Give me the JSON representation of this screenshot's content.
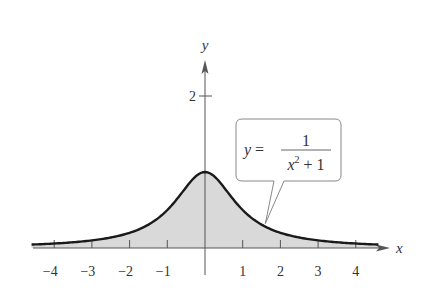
{
  "chart_data": {
    "type": "area",
    "title": "",
    "function": "y = 1/(x^2 + 1)",
    "xlabel": "x",
    "ylabel": "y",
    "xlim": [
      -4.7,
      4.7
    ],
    "ylim": [
      0,
      2.4
    ],
    "x_ticks": [
      -4,
      -3,
      -2,
      -1,
      1,
      2,
      3,
      4
    ],
    "x_tick_labels": [
      "−4",
      "−3",
      "−2",
      "−1",
      "1",
      "2",
      "3",
      "4"
    ],
    "y_ticks": [
      2
    ],
    "y_tick_labels": [
      "2"
    ],
    "grid": false,
    "shaded_region": "between curve and x-axis",
    "series": [
      {
        "name": "y = 1/(x^2+1)",
        "x": [
          -4.5,
          -4,
          -3.5,
          -3,
          -2.5,
          -2,
          -1.5,
          -1,
          -0.5,
          0,
          0.5,
          1,
          1.5,
          2,
          2.5,
          3,
          3.5,
          4,
          4.5
        ],
        "y": [
          0.047,
          0.059,
          0.075,
          0.1,
          0.138,
          0.2,
          0.308,
          0.5,
          0.8,
          1,
          0.8,
          0.5,
          0.308,
          0.2,
          0.138,
          0.1,
          0.075,
          0.059,
          0.047
        ]
      }
    ],
    "annotation": {
      "lhs": "y =",
      "numerator": "1",
      "denominator_base": "x",
      "denominator_exp": "2",
      "denominator_rest": " + 1",
      "points_to_x": 1.6
    },
    "colors": {
      "curve": "#1a1a1a",
      "fill": "#d9d9d9",
      "axis": "#555555",
      "callout_border": "#888888"
    }
  }
}
